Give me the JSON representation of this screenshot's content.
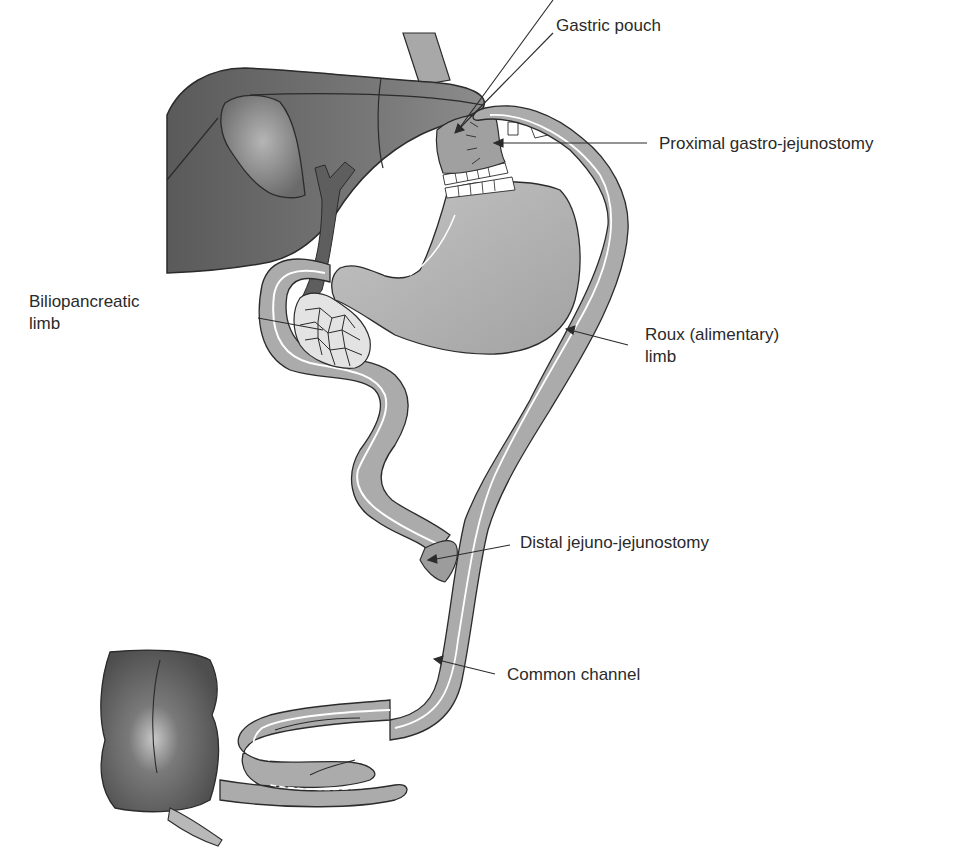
{
  "diagram": {
    "type": "anatomical-illustration",
    "colors": {
      "organ_dark": "#5e5e5e",
      "organ_mid": "#8a8a8a",
      "bowel": "#ababab",
      "stomach": "#b4b4b4",
      "outline": "#2b2b2b",
      "lumen_line": "#ffffff",
      "text": "#2a2a2a"
    },
    "labels": {
      "gastric_pouch": "Gastric pouch",
      "proximal_gj": "Proximal gastro-jejunostomy",
      "biliopancreatic_1": "Biliopancreatic",
      "biliopancreatic_2": "limb",
      "roux_1": "Roux (alimentary)",
      "roux_2": "limb",
      "distal_jj": "Distal jejuno-jejunostomy",
      "common_channel": "Common channel"
    },
    "structures": [
      "liver",
      "gallbladder",
      "bile duct",
      "esophagus",
      "gastric pouch",
      "remnant stomach",
      "duodenum",
      "pancreas",
      "biliopancreatic limb",
      "Roux limb",
      "common channel",
      "cecum",
      "appendix"
    ]
  }
}
